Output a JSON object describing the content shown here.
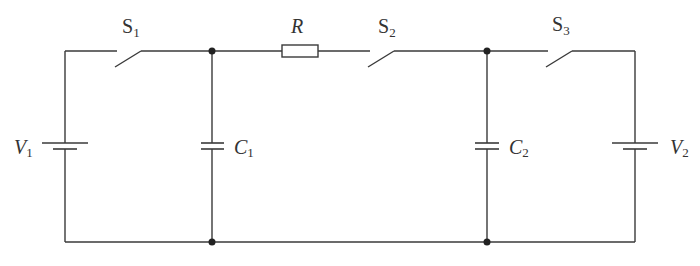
{
  "diagram": {
    "type": "circuit-schematic",
    "components": {
      "switches": [
        {
          "id": "S1",
          "label": "S",
          "subscript": "1",
          "state": "open"
        },
        {
          "id": "S2",
          "label": "S",
          "subscript": "2",
          "state": "open"
        },
        {
          "id": "S3",
          "label": "S",
          "subscript": "3",
          "state": "open"
        }
      ],
      "resistor": {
        "id": "R",
        "label": "R"
      },
      "capacitors": [
        {
          "id": "C1",
          "label": "C",
          "subscript": "1"
        },
        {
          "id": "C2",
          "label": "C",
          "subscript": "2"
        }
      ],
      "batteries": [
        {
          "id": "V1",
          "label": "V",
          "subscript": "1"
        },
        {
          "id": "V2",
          "label": "V",
          "subscript": "2"
        }
      ]
    },
    "colors": {
      "line": "#3a3a3a",
      "node": "#222222",
      "text": "#333333",
      "background": "#ffffff"
    }
  }
}
